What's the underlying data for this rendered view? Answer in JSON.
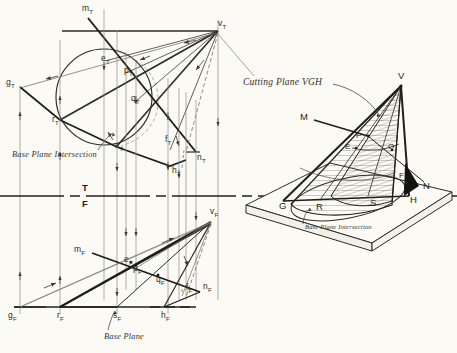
{
  "figure": {
    "kind": "descriptive-geometry-plate",
    "background_color": "#fbfaf4",
    "ink_color": "#2b2a26"
  },
  "top_view": {
    "points": [
      {
        "id": "m_t",
        "letter": "m",
        "sub": "T",
        "x": 86,
        "y": 10
      },
      {
        "id": "v_t",
        "letter": "v",
        "sub": "T",
        "x": 221,
        "y": 25
      },
      {
        "id": "g_t",
        "letter": "g",
        "sub": "T",
        "x": 9,
        "y": 84
      },
      {
        "id": "e_t",
        "letter": "e",
        "sub": "T",
        "x": 104,
        "y": 60
      },
      {
        "id": "p_t",
        "letter": "p",
        "sub": "T",
        "x": 125,
        "y": 73
      },
      {
        "id": "q_t",
        "letter": "q",
        "sub": "T",
        "x": 134,
        "y": 100
      },
      {
        "id": "r_t",
        "letter": "r",
        "sub": "T",
        "x": 56,
        "y": 121
      },
      {
        "id": "s_t",
        "letter": "s",
        "sub": "T",
        "x": 118,
        "y": 148
      },
      {
        "id": "f_t",
        "letter": "f",
        "sub": "T",
        "x": 168,
        "y": 142
      },
      {
        "id": "h_t",
        "letter": "h",
        "sub": "T",
        "x": 175,
        "y": 172
      },
      {
        "id": "n_t",
        "letter": "n",
        "sub": "T",
        "x": 199,
        "y": 160
      }
    ],
    "annotations": [
      {
        "id": "base-plane-intersection-top",
        "text": "Base Plane Intersection",
        "x": 12,
        "y": 152
      }
    ]
  },
  "fold_line": {
    "label_top": "T",
    "label_bottom": "F",
    "y": 196,
    "label_x": 84
  },
  "front_view": {
    "points": [
      {
        "id": "v_f",
        "letter": "v",
        "sub": "F",
        "x": 211,
        "y": 213
      },
      {
        "id": "m_f",
        "letter": "m",
        "sub": "F",
        "x": 78,
        "y": 251
      },
      {
        "id": "e_f",
        "letter": "e",
        "sub": "F",
        "x": 127,
        "y": 261
      },
      {
        "id": "p_f",
        "letter": "p",
        "sub": "F",
        "x": 136,
        "y": 269
      },
      {
        "id": "q_f",
        "letter": "q",
        "sub": "F",
        "x": 159,
        "y": 281
      },
      {
        "id": "f_f",
        "letter": "f",
        "sub": "F",
        "x": 188,
        "y": 290
      },
      {
        "id": "n_f",
        "letter": "n",
        "sub": "F",
        "x": 206,
        "y": 288
      },
      {
        "id": "g_f",
        "letter": "g",
        "sub": "F",
        "x": 11,
        "y": 318
      },
      {
        "id": "r_f",
        "letter": "r",
        "sub": "F",
        "x": 61,
        "y": 318
      },
      {
        "id": "s_f",
        "letter": "s",
        "sub": "F",
        "x": 117,
        "y": 318
      },
      {
        "id": "h_f",
        "letter": "h",
        "sub": "F",
        "x": 164,
        "y": 318
      }
    ],
    "annotations": [
      {
        "id": "base-plane-front",
        "text": "Base Plane",
        "x": 108,
        "y": 337
      }
    ]
  },
  "pictorial_view": {
    "title_note": "Cutting Plane VGH",
    "title_note_x": 243,
    "title_note_y": 82,
    "base_note": "Base Plane Intersection",
    "base_note_x": 305,
    "base_note_y": 227,
    "points": [
      {
        "id": "V",
        "letter": "V",
        "x": 401,
        "y": 78
      },
      {
        "id": "M",
        "letter": "M",
        "x": 304,
        "y": 117
      },
      {
        "id": "P",
        "letter": "P",
        "x": 356,
        "y": 137
      },
      {
        "id": "E",
        "letter": "E",
        "x": 347,
        "y": 147
      },
      {
        "id": "O",
        "letter": "O",
        "x": 390,
        "y": 148
      },
      {
        "id": "F",
        "letter": "F",
        "x": 401,
        "y": 177
      },
      {
        "id": "N",
        "letter": "N",
        "x": 425,
        "y": 186
      },
      {
        "id": "H",
        "letter": "H",
        "x": 412,
        "y": 200
      },
      {
        "id": "S",
        "letter": "S",
        "x": 372,
        "y": 203
      },
      {
        "id": "R",
        "letter": "R",
        "x": 318,
        "y": 207
      },
      {
        "id": "G",
        "letter": "G",
        "x": 281,
        "y": 206
      }
    ]
  }
}
